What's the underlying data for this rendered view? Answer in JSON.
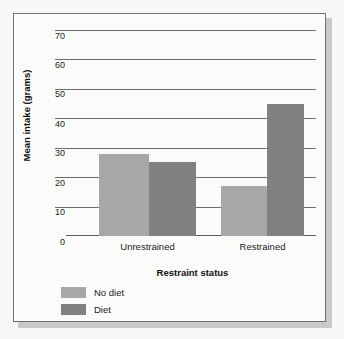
{
  "chart_data": {
    "type": "bar",
    "title": "",
    "xlabel": "Restraint status",
    "ylabel": "Mean intake (grams)",
    "categories": [
      "Unrestrained",
      "Restrained"
    ],
    "series": [
      {
        "name": "No diet",
        "values": [
          28,
          17
        ],
        "color": "#a8a8a8"
      },
      {
        "name": "Diet",
        "values": [
          25,
          45
        ],
        "color": "#808080"
      }
    ],
    "ylim": [
      0,
      70
    ],
    "yticks": [
      0,
      10,
      20,
      30,
      40,
      50,
      60,
      70
    ],
    "ytick_labels": [
      "0",
      "10",
      "20",
      "30",
      "40",
      "50",
      "60",
      "70"
    ],
    "grid": true,
    "legend_position": "bottom-left"
  },
  "legend": {
    "items": [
      {
        "label": "No diet",
        "color": "#a8a8a8"
      },
      {
        "label": "Diet",
        "color": "#808080"
      }
    ]
  },
  "axes": {
    "x_title": "Restraint status",
    "y_title": "Mean intake (grams)"
  },
  "colors": {
    "no_diet": "#a8a8a8",
    "diet": "#808080",
    "gridline": "#6d6d6d",
    "frame": "#6f6f6f",
    "plot_background": "#fbfbfa",
    "page_background": "#f7f7f6"
  }
}
